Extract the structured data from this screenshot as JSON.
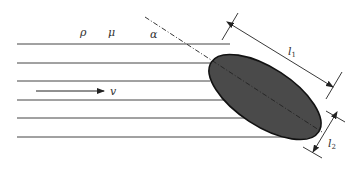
{
  "diagram": {
    "labels": {
      "density": "ρ",
      "viscosity": "μ",
      "angle": "α",
      "velocity": "v",
      "length_major": "l",
      "length_major_sub": "1",
      "length_minor": "l",
      "length_minor_sub": "2"
    },
    "colors": {
      "stroke": "#333333",
      "particle_fill": "#4a4a4a",
      "background": "#ffffff"
    },
    "streamlines_y": [
      44,
      63,
      81,
      100,
      118,
      137
    ]
  }
}
